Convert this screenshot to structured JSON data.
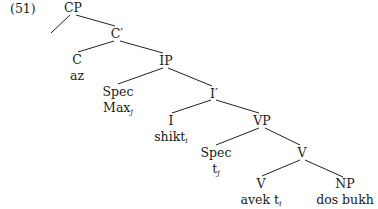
{
  "example_number": "(51)",
  "tree": {
    "nodes": {
      "cp": "CP",
      "c_bar": "C′",
      "c": "C",
      "c_word": "az",
      "ip": "IP",
      "spec_ip": "Spec",
      "spec_ip_word": "Max",
      "spec_ip_word_sub": "j",
      "i_bar": "I′",
      "i": "I",
      "i_word": "shikt",
      "i_word_sub": "i",
      "vp": "VP",
      "spec_vp": "Spec",
      "spec_vp_word": "t",
      "spec_vp_word_sub": "j",
      "v_bar": "V",
      "v": "V",
      "v_word": "avek t",
      "v_word_sub": "i",
      "np": "NP",
      "np_word": "dos bukh"
    },
    "edges": [
      [
        "CP",
        "(empty spec)"
      ],
      [
        "CP",
        "C′"
      ],
      [
        "C′",
        "C"
      ],
      [
        "C′",
        "IP"
      ],
      [
        "IP",
        "Spec"
      ],
      [
        "IP",
        "I′"
      ],
      [
        "I′",
        "I"
      ],
      [
        "I′",
        "VP"
      ],
      [
        "VP",
        "Spec"
      ],
      [
        "VP",
        "V"
      ],
      [
        "V",
        "V"
      ],
      [
        "V",
        "NP"
      ]
    ]
  }
}
